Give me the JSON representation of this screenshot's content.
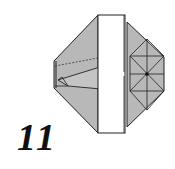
{
  "step": {
    "number": "11"
  },
  "colors": {
    "paper_gray": "#b8b8b8",
    "paper_white": "#ffffff",
    "line": "#222222"
  }
}
